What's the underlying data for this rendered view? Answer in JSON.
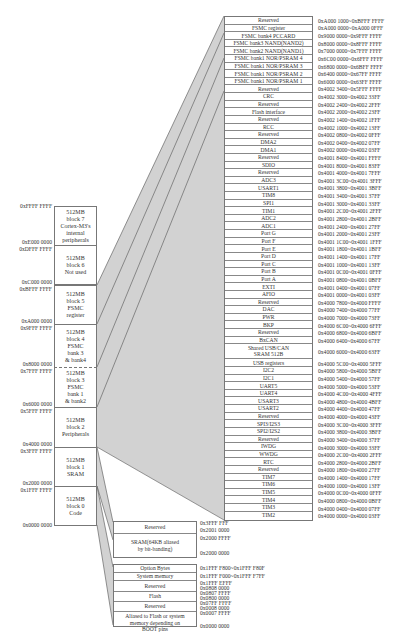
{
  "blocks": [
    {
      "id": "block7",
      "lines": [
        "512MB",
        "block 7",
        "Cortex-M3's",
        "internal",
        "peripherals"
      ],
      "top_addr": "0xFFFF FFFF",
      "bottom_addr": "0xE000 0000"
    },
    {
      "id": "block6",
      "lines": [
        "512MB",
        "block 6",
        "Not used"
      ],
      "top_addr": "0xDFFF FFFF",
      "bottom_addr": "0xC000 0000"
    },
    {
      "id": "block5",
      "lines": [
        "512MB",
        "block 5",
        "FSMC",
        "register"
      ],
      "top_addr": "0xBFFF FFFF",
      "bottom_addr": "0xA000 0000"
    },
    {
      "id": "block4",
      "lines": [
        "512MB",
        "block 4",
        "FSMC",
        "bank 3",
        "& bank4"
      ],
      "top_addr": "0x9FFF FFFF",
      "bottom_addr": "0x8000 0000"
    },
    {
      "id": "block3",
      "lines": [
        "512MB",
        "block 3",
        "FSMC",
        "bank 1",
        "& bank2"
      ],
      "top_addr": "0x7FFF FFFF",
      "bottom_addr": "0x6000 0000"
    },
    {
      "id": "block2",
      "lines": [
        "512MB",
        "block 2",
        "Peripherals"
      ],
      "top_addr": "0x5FFF FFFF",
      "bottom_addr": "0x4000 0000"
    },
    {
      "id": "block1",
      "lines": [
        "512MB",
        "block 1",
        "SRAM"
      ],
      "top_addr": "0x3FFF FFFF",
      "bottom_addr": "0x2000 0000"
    },
    {
      "id": "block0",
      "lines": [
        "512MB",
        "block 0",
        "Code"
      ],
      "top_addr": "0x1FFF FFFF",
      "bottom_addr": "0x0000 0000"
    }
  ],
  "peripheral_table": [
    {
      "name": "Reserved",
      "range": "0xA000 1000~0xBFFF FFFF"
    },
    {
      "name": "FSMC register",
      "range": "0xA000 0000~0xA000 0FFF"
    },
    {
      "name": "FSMC bank4 PCCARD",
      "range": "0x9000 0000~0x9FFF FFFF"
    },
    {
      "name": "FSMC bank3 NAND(NAND2)",
      "range": "0x8000 0000~0x8FFF FFFF"
    },
    {
      "name": "FSMC bank2 NAND(NAND1)",
      "range": "0x7000 0000~0x7FFF FFFF"
    },
    {
      "name": "FSMC bank1 NOR/PSRAM 4",
      "range": "0x6C00 0000~0x6FFF FFFF"
    },
    {
      "name": "FSMC bank1 NOR/PSRAM 3",
      "range": "0x6800 0000~0x6BFF FFFF"
    },
    {
      "name": "FSMC bank1 NOR/PSRAM 2",
      "range": "0x6400 0000~0x67FF FFFF"
    },
    {
      "name": "FSMC bank1 NOR/PSRAM 1",
      "range": "0x6000 0000~0x63FF FFFF"
    },
    {
      "name": "Reserved",
      "range": "0x4002 3400~0x5FFF FFFF"
    },
    {
      "name": "CRC",
      "range": "0x4002 3000~0x4002 33FF"
    },
    {
      "name": "Reserved",
      "range": "0x4002 2400~0x4002 2FFF"
    },
    {
      "name": "Flash interface",
      "range": "0x4002 2000~0x4002 23FF"
    },
    {
      "name": "Reserved",
      "range": "0x4002 1400~0x4002 1FFF"
    },
    {
      "name": "RCC",
      "range": "0x4002 1000~0x4002 13FF"
    },
    {
      "name": "Reserved",
      "range": "0x4002 0800~0x4002 0FFF"
    },
    {
      "name": "DMA2",
      "range": "0x4002 0400~0x4002 07FF"
    },
    {
      "name": "DMA1",
      "range": "0x4002 0000~0x4002 03FF"
    },
    {
      "name": "Reserved",
      "range": "0x4001 8400~0x4001 FFFF"
    },
    {
      "name": "SDIO",
      "range": "0x4001 8000~0x4001 83FF"
    },
    {
      "name": "Reserved",
      "range": "0x4001 4000~0x4001 7FFF"
    },
    {
      "name": "ADC3",
      "range": "0x4001 3C00~0x4001 3FFF"
    },
    {
      "name": "USART1",
      "range": "0x4001 3800~0x4001 3BFF"
    },
    {
      "name": "TIM8",
      "range": "0x4001 3400~0x4001 37FF"
    },
    {
      "name": "SPI1",
      "range": "0x4001 3000~0x4001 33FF"
    },
    {
      "name": "TIM1",
      "range": "0x4001 2C00~0x4001 2FFF"
    },
    {
      "name": "ADC2",
      "range": "0x4001 2800~0x4001 2BFF"
    },
    {
      "name": "ADC1",
      "range": "0x4001 2400~0x4001 27FF"
    },
    {
      "name": "Port G",
      "range": "0x4001 2000~0x4001 23FF"
    },
    {
      "name": "Port F",
      "range": "0x4001 1C00~0x4001 1FFF"
    },
    {
      "name": "Port E",
      "range": "0x4001 1800~0x4001 1BFF"
    },
    {
      "name": "Port D",
      "range": "0x4001 1400~0x4001 17FF"
    },
    {
      "name": "Port C",
      "range": "0x4001 1000~0x4001 13FF"
    },
    {
      "name": "Port B",
      "range": "0x4001 0C00~0x4001 0FFF"
    },
    {
      "name": "Port A",
      "range": "0x4001 0800~0x4001 0BFF"
    },
    {
      "name": "EXTI",
      "range": "0x4001 0400~0x4001 07FF"
    },
    {
      "name": "AFIO",
      "range": "0x4001 0000~0x4001 03FF"
    },
    {
      "name": "Reserved",
      "range": "0x4000 7800~0x4000 FFFF"
    },
    {
      "name": "DAC",
      "range": "0x4000 7400~0x4000 77FF"
    },
    {
      "name": "PWR",
      "range": "0x4000 7000~0x4000 73FF"
    },
    {
      "name": "BKP",
      "range": "0x4000 6C00~0x4000 6FFF"
    },
    {
      "name": "Reserved",
      "range": "0x4000 6800~0x4000 6BFF"
    },
    {
      "name": "BxCAN",
      "range": "0x4000 6400~0x4000 67FF"
    },
    {
      "name": "Shared USB/CAN SRAM 512B",
      "line1": "Shared USB/CAN",
      "line2": "SRAM 512B",
      "range": "0x4000 6000~0x4000 63FF",
      "double": true
    },
    {
      "name": "USB registers",
      "range": "0x4000 5C00~0x4000 5FFF"
    },
    {
      "name": "I2C2",
      "range": "0x4000 5800~0x4000 5BFF"
    },
    {
      "name": "I2C1",
      "range": "0x4000 5400~0x4000 57FF"
    },
    {
      "name": "UART5",
      "range": "0x4000 5000~0x4000 53FF"
    },
    {
      "name": "UART4",
      "range": "0x4000 4C00~0x4000 4FFF"
    },
    {
      "name": "USART3",
      "range": "0x4000 4800~0x4000 4BFF"
    },
    {
      "name": "USART2",
      "range": "0x4000 4400~0x4000 47FF"
    },
    {
      "name": "Reserved",
      "range": "0x4000 4000~0x4000 43FF"
    },
    {
      "name": "SPI3/I2S3",
      "range": "0x4000 3C00~0x4000 3FFF"
    },
    {
      "name": "SPI2/I2S2",
      "range": "0x4000 3800~0x4000 3BFF"
    },
    {
      "name": "Reserved",
      "range": "0x4000 3400~0x4000 37FF"
    },
    {
      "name": "IWDG",
      "range": "0x4000 3000~0x4000 33FF"
    },
    {
      "name": "WWDG",
      "range": "0x4000 2C00~0x4000 2FFF"
    },
    {
      "name": "RTC",
      "range": "0x4000 2800~0x4000 2BFF"
    },
    {
      "name": "Reserved",
      "range": "0x4000 1800~0x4000 27FF"
    },
    {
      "name": "TIM7",
      "range": "0x4000 1400~0x4000 17FF"
    },
    {
      "name": "TIM6",
      "range": "0x4000 1000~0x4000 13FF"
    },
    {
      "name": "TIM5",
      "range": "0x4000 0C00~0x4000 0FFF"
    },
    {
      "name": "TIM4",
      "range": "0x4000 0800~0x4000 0BFF"
    },
    {
      "name": "TIM3",
      "range": "0x4000 0400~0x4000 07FF"
    },
    {
      "name": "TIM2",
      "range": "0x4000 0000~0x4000 03FF"
    }
  ],
  "sram_table": [
    {
      "name": "Reserved",
      "addrs": [
        "0x3FFF FFF",
        "0x2001 0000"
      ]
    },
    {
      "name_lines": [
        "SRAM(64KB aliased",
        "by bit-banding)"
      ],
      "addrs": [
        "0x2000 FFFF",
        "0x2000 0000"
      ]
    }
  ],
  "code_table": [
    {
      "name": "Option Bytes",
      "range": "0x1FFF F800~0x1FFF F80F"
    },
    {
      "name": "System memory",
      "range": "0x1FFF F000~0x1FFF F7FF"
    },
    {
      "name": "Reserved",
      "addrs": [
        "0x1FFF EFFF",
        "0x0808 0000"
      ]
    },
    {
      "name": "Flash",
      "addrs": [
        "0x0807 FFFF",
        "0x0800 0000"
      ]
    },
    {
      "name": "Reserved",
      "addrs": [
        "0x07FF FFFF",
        "0x0008 0000"
      ]
    },
    {
      "name_lines": [
        "Aliased to Flash or system",
        "memory depending on",
        "BOOT pins"
      ],
      "addrs": [
        "0x0007 FFFF",
        "0x0000 0000"
      ]
    }
  ],
  "colors": {
    "line": "#666666",
    "shade": "#cfcfcf",
    "border": "#777777",
    "text": "#333333"
  }
}
